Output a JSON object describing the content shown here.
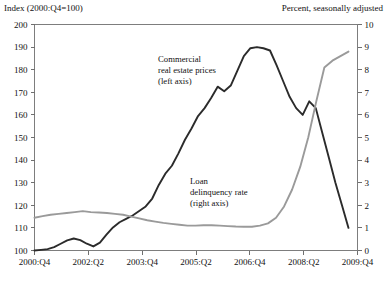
{
  "figure": {
    "left_axis_title": "Index (2000:Q4=100)",
    "right_axis_title": "Percent, seasonally adjusted"
  },
  "chart_data": {
    "type": "line",
    "title": "",
    "xlabel": "",
    "ylabel": "Index (2000:Q4=100)",
    "y2label": "Percent, seasonally adjusted",
    "grid": false,
    "legend": "annotations-inline",
    "xlim": [
      0,
      36
    ],
    "ylim": [
      100,
      200
    ],
    "y2lim": [
      0,
      10
    ],
    "xticks": [
      0,
      6,
      12,
      18,
      24,
      30,
      36
    ],
    "xticklabels": [
      "2000:Q4",
      "2002:Q2",
      "2003:Q4",
      "2005:Q2",
      "2006:Q4",
      "2008:Q2",
      "2009:Q4"
    ],
    "yticks": [
      100,
      110,
      120,
      130,
      140,
      150,
      160,
      170,
      180,
      190,
      200
    ],
    "y2ticks": [
      0,
      1,
      2,
      3,
      4,
      5,
      6,
      7,
      8,
      9,
      10
    ],
    "x": [
      0,
      1,
      2,
      3,
      4,
      5,
      6,
      7,
      8,
      9,
      10,
      11,
      12,
      13,
      14,
      15,
      16,
      17,
      18,
      19,
      20,
      21,
      22,
      23,
      24,
      25,
      26,
      27,
      28,
      29,
      30,
      31,
      32,
      33,
      34,
      35,
      36
    ],
    "series": [
      {
        "name": "Commercial real estate prices (left axis)",
        "axis": "left",
        "color": "#2b2b2b",
        "width": 1.9,
        "units": "index",
        "values": [
          100.0,
          100.3,
          100.6,
          101.5,
          103.0,
          104.5,
          105.3,
          104.6,
          103.0,
          101.8,
          103.5,
          107.0,
          110.2,
          112.5,
          114.0,
          115.5,
          117.5,
          119.5,
          123.0,
          129.0,
          134.0,
          137.5,
          143.0,
          149.0,
          154.0,
          159.5,
          163.0,
          167.5,
          172.5,
          170.5,
          173.0,
          179.5,
          186.0,
          189.5,
          190.0,
          189.5,
          188.5
        ]
      },
      {
        "name": "Loan delinquency rate (right axis)",
        "axis": "right",
        "color": "#9a9a9a",
        "width": 1.9,
        "units": "percent",
        "values": [
          1.45,
          1.52,
          1.58,
          1.62,
          1.66,
          1.7,
          1.74,
          1.7,
          1.68,
          1.66,
          1.62,
          1.58,
          1.5,
          1.42,
          1.34,
          1.28,
          1.22,
          1.18,
          1.14,
          1.1,
          1.1,
          1.12,
          1.12,
          1.1,
          1.08,
          1.06,
          1.05,
          1.05,
          1.1,
          1.2,
          1.45,
          1.95,
          2.7,
          3.7,
          5.0,
          6.6,
          8.1
        ]
      }
    ],
    "series_tail": {
      "note": "final quarters continue past index 36 to chart edge",
      "commercial_real_estate_prices": [
        182.0,
        175.0,
        168.0,
        163.0,
        160.0,
        166.0,
        163.0,
        152.0,
        141.0,
        130.0,
        120.0,
        110.0
      ],
      "loan_delinquency_rate": [
        8.4,
        8.6,
        8.8
      ]
    },
    "annotations": [
      {
        "name": "commercial-real-estate-prices-label",
        "lines": [
          "Commercial",
          "real estate prices",
          "(left axis)"
        ],
        "x": 158,
        "y": 62
      },
      {
        "name": "loan-delinquency-rate-label",
        "lines": [
          "Loan",
          "delinquency rate",
          "(right axis)"
        ],
        "x": 190,
        "y": 184
      }
    ]
  }
}
